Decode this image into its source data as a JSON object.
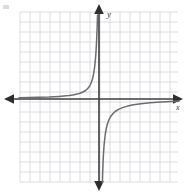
{
  "figure": {
    "name": "coordinate-plane-hyperbola",
    "background_color": "#ffffff"
  },
  "axes": {
    "x_label": "x",
    "y_label": "y",
    "color": "#3d3d3d",
    "origin_px": [
      99,
      99
    ],
    "arrowheads": [
      "left",
      "right",
      "up",
      "down"
    ]
  },
  "grid": {
    "color": "#d8d8dc",
    "cell_px": 10,
    "left_px": 20,
    "top_px": 12,
    "right_px": 178,
    "bottom_px": 182,
    "columns": 16,
    "rows": 17
  },
  "chart_data": {
    "type": "line",
    "title": "",
    "xlabel": "x",
    "ylabel": "y",
    "grid": true,
    "legend": null,
    "curve_color": "#6b6b70",
    "xlim": [
      -8,
      8
    ],
    "ylim": [
      -8.5,
      8.5
    ],
    "asymptotes": {
      "vertical_x": 0.2,
      "horizontal_y": 0
    },
    "series": [
      {
        "name": "branch-upper-left",
        "quadrant": "II",
        "x": [
          -8.0,
          -7.0,
          -6.0,
          -5.0,
          -4.5,
          -4.0,
          -3.5,
          -3.0,
          -2.6,
          -2.2,
          -1.9,
          -1.6,
          -1.35,
          -1.15,
          -0.98,
          -0.85,
          -0.74,
          -0.64,
          -0.56,
          -0.49,
          -0.43,
          -0.38,
          -0.33,
          -0.29,
          -0.25,
          -0.22,
          -0.19,
          -0.165,
          -0.145
        ],
        "y": [
          0.12,
          0.14,
          0.17,
          0.2,
          0.23,
          0.26,
          0.3,
          0.35,
          0.41,
          0.49,
          0.58,
          0.7,
          0.85,
          1.02,
          1.22,
          1.45,
          1.72,
          2.05,
          2.4,
          2.8,
          3.25,
          3.75,
          4.3,
          4.9,
          5.6,
          6.3,
          7.0,
          7.8,
          8.4
        ]
      },
      {
        "name": "branch-lower-right",
        "quadrant": "IV",
        "x": [
          0.34,
          0.36,
          0.39,
          0.42,
          0.46,
          0.51,
          0.57,
          0.64,
          0.73,
          0.84,
          0.98,
          1.15,
          1.36,
          1.62,
          1.95,
          2.35,
          2.85,
          3.45,
          4.2,
          5.1,
          6.2,
          7.2,
          8.0
        ],
        "y": [
          -8.4,
          -7.6,
          -6.8,
          -6.0,
          -5.3,
          -4.6,
          -4.0,
          -3.45,
          -2.95,
          -2.5,
          -2.1,
          -1.78,
          -1.5,
          -1.25,
          -1.04,
          -0.86,
          -0.71,
          -0.58,
          -0.47,
          -0.38,
          -0.3,
          -0.24,
          -0.2
        ]
      }
    ]
  }
}
